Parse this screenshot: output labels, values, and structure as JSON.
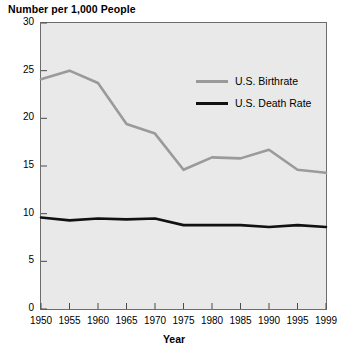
{
  "chart_data": {
    "type": "line",
    "title": "Number per 1,000 People",
    "xlabel": "Year",
    "ylabel": "",
    "xlim": [
      1950,
      1999
    ],
    "ylim": [
      0,
      30
    ],
    "grid": false,
    "legend_position": "inside-top-right",
    "x": [
      1950,
      1955,
      1960,
      1965,
      1970,
      1975,
      1980,
      1985,
      1990,
      1995,
      1999
    ],
    "xticks": [
      "1950",
      "1955",
      "1960",
      "1965",
      "1970",
      "1975",
      "1980",
      "1985",
      "1990",
      "1995",
      "1999"
    ],
    "yticks": [
      "0",
      "5",
      "10",
      "15",
      "20",
      "25",
      "30"
    ],
    "ytick_values": [
      0,
      5,
      10,
      15,
      20,
      25,
      30
    ],
    "series": [
      {
        "name": "U.S. Birthrate",
        "color": "#9a9a9a",
        "values": [
          24.1,
          25.0,
          23.7,
          19.4,
          18.4,
          14.6,
          15.9,
          15.8,
          16.7,
          14.6,
          14.3
        ]
      },
      {
        "name": "U.S. Death Rate",
        "color": "#111111",
        "values": [
          9.6,
          9.3,
          9.5,
          9.4,
          9.5,
          8.8,
          8.8,
          8.8,
          8.6,
          8.8,
          8.6
        ]
      }
    ]
  },
  "legend": {
    "items": [
      {
        "label": "U.S. Birthrate"
      },
      {
        "label": "U.S. Death Rate"
      }
    ]
  }
}
